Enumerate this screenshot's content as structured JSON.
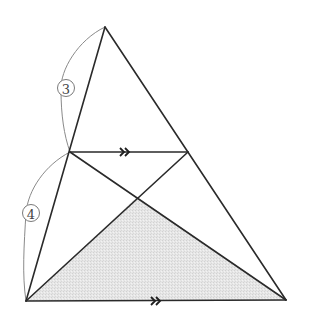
{
  "diagram": {
    "type": "geometry-triangle-parallel-line",
    "colors": {
      "stroke": "#2a2a2a",
      "shade": "#e4e4e4",
      "arc": "#8a8a8a",
      "label": "#444444"
    },
    "points": {
      "A": [
        105,
        27
      ],
      "D": [
        70,
        152
      ],
      "E": [
        188,
        152
      ],
      "B": [
        26,
        301
      ],
      "C": [
        286,
        300
      ],
      "P": [
        137,
        197
      ]
    },
    "segments": [
      {
        "from": "A",
        "to": "B",
        "name": "side-ab"
      },
      {
        "from": "A",
        "to": "C",
        "name": "side-ac"
      },
      {
        "from": "B",
        "to": "C",
        "name": "base-bc"
      },
      {
        "from": "D",
        "to": "E",
        "name": "parallel-de"
      },
      {
        "from": "D",
        "to": "C",
        "name": "diagonal-dc"
      },
      {
        "from": "E",
        "to": "B",
        "name": "diagonal-eb"
      }
    ],
    "shaded_region": [
      "B",
      "P",
      "C"
    ],
    "parallel_marks": [
      {
        "segment": "DE",
        "glyph": "»",
        "position": [
          125,
          152
        ]
      },
      {
        "segment": "BC",
        "glyph": "»",
        "position": [
          156,
          301
        ]
      }
    ],
    "ratio_labels": [
      {
        "label": "3",
        "segment": "AD",
        "position": [
          68,
          88
        ]
      },
      {
        "label": "4",
        "segment": "DB",
        "position": [
          32,
          213
        ]
      }
    ]
  }
}
